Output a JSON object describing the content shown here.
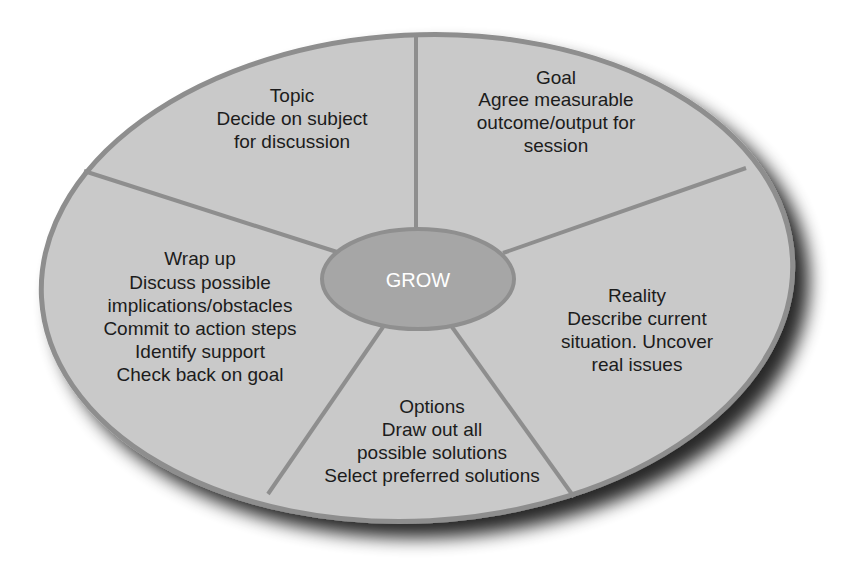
{
  "diagram": {
    "center_label": "GROW",
    "colors": {
      "background": "#ffffff",
      "segment_fill": "#c9c9c9",
      "border": "#8e8e8e",
      "center_fill": "#a6a6a6",
      "center_border": "#8f8f8f",
      "text": "#1c1c1c",
      "center_text": "#ffffff",
      "shadow": "#3a3a3a"
    },
    "segments": [
      {
        "id": "topic",
        "title": "Topic",
        "lines": [
          "Decide on subject",
          "for discussion"
        ]
      },
      {
        "id": "goal",
        "title": "Goal",
        "lines": [
          "Agree measurable",
          "outcome/output for",
          "session"
        ]
      },
      {
        "id": "reality",
        "title": "Reality",
        "lines": [
          "Describe current",
          "situation. Uncover",
          "real issues"
        ]
      },
      {
        "id": "options",
        "title": "Options",
        "lines": [
          "Draw out all",
          "possible solutions",
          "Select preferred solutions"
        ]
      },
      {
        "id": "wrap-up",
        "title": "Wrap up",
        "lines": [
          "Discuss possible",
          "implications/obstacles",
          "Commit to action steps",
          "Identify support",
          "Check back on goal"
        ]
      }
    ]
  }
}
